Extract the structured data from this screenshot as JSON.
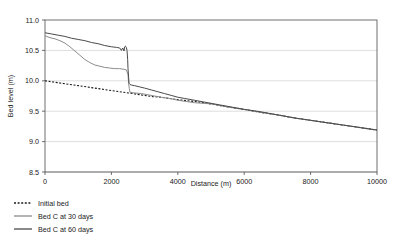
{
  "chart_data": {
    "type": "line",
    "title": "",
    "xlabel": "Distance (m)",
    "ylabel": "Bed level (m)",
    "xlim": [
      0,
      10000
    ],
    "ylim": [
      8.5,
      11.0
    ],
    "xticks": [
      0,
      2000,
      4000,
      6000,
      8000,
      10000
    ],
    "xtick_labels": [
      "0",
      "2000",
      "4000",
      "6000",
      "8000",
      "10000"
    ],
    "yticks": [
      8.5,
      9.0,
      9.5,
      10.0,
      10.5,
      11.0
    ],
    "ytick_labels": [
      "8.5",
      "9.0",
      "9.5",
      "10.0",
      "10.5",
      "11.0"
    ],
    "grid": "horizontal",
    "legend_position": "below-left",
    "series": [
      {
        "name": "Initial bed",
        "style": "dotted",
        "color": "#1a1a1a",
        "width": 1.1,
        "x": [
          0,
          250,
          500,
          750,
          1000,
          1250,
          1500,
          1750,
          2000,
          2250,
          2500,
          2550,
          2750,
          3000,
          3250,
          3500,
          3750,
          4000,
          4500,
          5000,
          5500,
          6000,
          6500,
          7000,
          7500,
          8000,
          8500,
          9000,
          9500,
          10000
        ],
        "y": [
          10.0,
          9.98,
          9.96,
          9.94,
          9.92,
          9.9,
          9.88,
          9.86,
          9.84,
          9.82,
          9.8,
          9.8,
          9.78,
          9.76,
          9.74,
          9.73,
          9.71,
          9.69,
          9.66,
          9.62,
          9.57,
          9.53,
          9.48,
          9.44,
          9.39,
          9.35,
          9.31,
          9.27,
          9.23,
          9.19
        ]
      },
      {
        "name": "Bed C at 30 days",
        "style": "solid",
        "color": "#8c8c8c",
        "width": 1.0,
        "x": [
          0,
          150,
          300,
          450,
          600,
          750,
          900,
          1050,
          1200,
          1350,
          1500,
          1650,
          1800,
          1950,
          2100,
          2250,
          2380,
          2450,
          2500,
          2520,
          2540,
          2560,
          2700,
          2900,
          3100,
          3300,
          3500,
          3750,
          4000,
          4250,
          4500,
          5000,
          5500,
          6000,
          6500,
          7000,
          7500,
          8000,
          8500,
          9000,
          9500,
          10000
        ],
        "y": [
          10.74,
          10.71,
          10.69,
          10.66,
          10.62,
          10.56,
          10.49,
          10.42,
          10.35,
          10.3,
          10.26,
          10.24,
          10.22,
          10.21,
          10.2,
          10.2,
          10.19,
          10.18,
          10.1,
          9.95,
          9.87,
          9.81,
          9.8,
          9.79,
          9.77,
          9.75,
          9.73,
          9.71,
          9.68,
          9.66,
          9.64,
          9.62,
          9.57,
          9.53,
          9.48,
          9.44,
          9.39,
          9.35,
          9.31,
          9.27,
          9.23,
          9.19
        ]
      },
      {
        "name": "Bed C at 60 days",
        "style": "solid",
        "color": "#4a4a4a",
        "width": 1.0,
        "x": [
          0,
          200,
          400,
          600,
          800,
          1000,
          1200,
          1400,
          1600,
          1800,
          2000,
          2150,
          2250,
          2300,
          2340,
          2380,
          2400,
          2420,
          2450,
          2470,
          2490,
          2500,
          2520,
          2530,
          2545,
          2560,
          2600,
          2700,
          2850,
          3000,
          3200,
          3400,
          3600,
          3800,
          4000,
          4200,
          4500,
          5000,
          5500,
          6000,
          6500,
          7000,
          7500,
          8000,
          8500,
          9000,
          9500,
          10000
        ],
        "y": [
          10.79,
          10.77,
          10.75,
          10.73,
          10.7,
          10.68,
          10.66,
          10.63,
          10.61,
          10.58,
          10.56,
          10.55,
          10.54,
          10.5,
          10.54,
          10.49,
          10.56,
          10.57,
          10.55,
          10.5,
          10.35,
          10.2,
          10.05,
          9.96,
          9.95,
          9.94,
          9.93,
          9.92,
          9.9,
          9.88,
          9.85,
          9.82,
          9.79,
          9.76,
          9.73,
          9.71,
          9.68,
          9.63,
          9.58,
          9.53,
          9.49,
          9.44,
          9.39,
          9.35,
          9.31,
          9.27,
          9.23,
          9.19
        ]
      }
    ]
  },
  "legend": {
    "items": [
      {
        "label": "Initial bed"
      },
      {
        "label": "Bed C at 30 days"
      },
      {
        "label": "Bed C at 60 days"
      }
    ]
  }
}
